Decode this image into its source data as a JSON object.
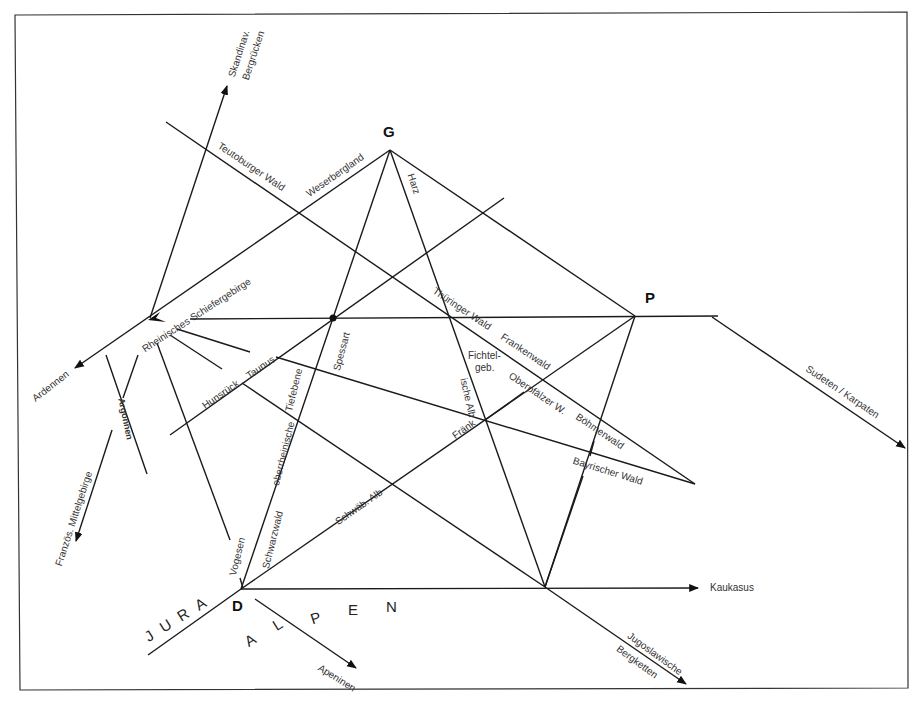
{
  "diagram": {
    "title": "",
    "nodes": {
      "G": {
        "label": "G",
        "x": 390,
        "y": 150
      },
      "P": {
        "label": "P",
        "x": 635,
        "y": 316
      },
      "D": {
        "label": "D",
        "x": 241,
        "y": 589
      }
    },
    "labels": {
      "skandinav": "Skandinav.",
      "bergruecken": "Bergrücken",
      "teutoburger": "Teutoburger Wald",
      "weserbergland": "Weserbergland",
      "harz": "Harz",
      "rheinisches": "Rheinisches Schiefergebirge",
      "spessart": "Spessart",
      "thueringer": "Thüringer Wald",
      "frankenwald": "Frankenwald",
      "fichtel1": "Fichtel-",
      "fichtel2": "geb.",
      "oberpfaelzer": "Oberpfälzer W.",
      "boehmerwald": "Böhmerwald",
      "bayrischer": "Bayrischer Wald",
      "fraenk": "Fränk",
      "ischealb": "ische Alb",
      "sudeten": "Sudeten / Karpaten",
      "ardennen": "Ardennen",
      "argonnen": "Argonnen",
      "hunsrueck": "Hunsrück",
      "taunus": "Taunus",
      "tiefebene": "Tiefebene",
      "oberrheinische": "oberrheinische",
      "schwaebalb": "Schwäb. Alb",
      "schwarzwald": "Schwarzwald",
      "vogesen": "Vogesen",
      "franzoes": "Französ. Mittelgebirge",
      "jura": "JURA",
      "alpen_a": "A",
      "alpen_l": "L",
      "alpen_p": "P",
      "alpen_e": "E",
      "alpen_n": "N",
      "apeninen": "Apeninen",
      "kaukasus": "Kaukasus",
      "jugoslawische": "Jugoslawische",
      "bergketten": "Bergketten"
    },
    "colors": {
      "line": "#1a1a1a",
      "text": "#333333",
      "frame": "#333333"
    }
  }
}
